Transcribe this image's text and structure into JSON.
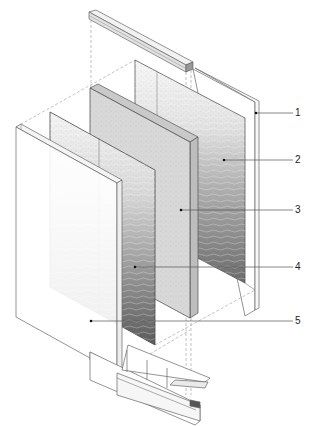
{
  "diagram": {
    "type": "exploded-isometric-assembly",
    "colors": {
      "line": "#555555",
      "dashed": "#9a9a9a",
      "core_fill": "#d6d6d6",
      "texture_light": "#efefef",
      "texture_dark": "#5a5a5a",
      "background": "#ffffff"
    },
    "callouts": [
      {
        "id": "1",
        "label": "1",
        "part": "rear frame / glass pane",
        "anchor": [
          256,
          113
        ],
        "label_pos": [
          296,
          108
        ]
      },
      {
        "id": "2",
        "label": "2",
        "part": "rear textured glass panel",
        "anchor": [
          224,
          160
        ],
        "label_pos": [
          296,
          155
        ]
      },
      {
        "id": "3",
        "label": "3",
        "part": "central core panel",
        "anchor": [
          181,
          210
        ],
        "label_pos": [
          296,
          205
        ]
      },
      {
        "id": "4",
        "label": "4",
        "part": "front textured glass panel",
        "anchor": [
          135,
          267
        ],
        "label_pos": [
          296,
          262
        ]
      },
      {
        "id": "5",
        "label": "5",
        "part": "front frame / glass pane",
        "anchor": [
          91,
          321
        ],
        "label_pos": [
          296,
          316
        ]
      }
    ]
  }
}
